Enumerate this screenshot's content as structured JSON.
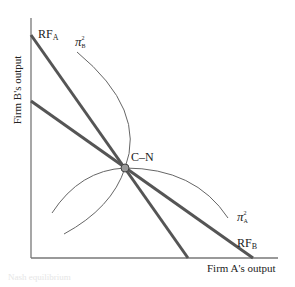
{
  "diagram": {
    "axes": {
      "x_label": "Firm A's output",
      "y_label": "Firm B's output"
    },
    "curves": {
      "rf_a": {
        "label_main": "RF",
        "label_sub": "A",
        "color": "#555555"
      },
      "rf_b": {
        "label_main": "RF",
        "label_sub": "B",
        "color": "#555555"
      },
      "pi_b": {
        "label_main": "π",
        "label_sup": "2",
        "label_sub": "B",
        "color": "#666666"
      },
      "pi_a": {
        "label_main": "π",
        "label_sup": "2",
        "label_sub": "A",
        "color": "#666666"
      }
    },
    "equilibrium": {
      "label": "C–N",
      "fill": "#999999"
    },
    "caption_fragment": "Nash equilibrium"
  }
}
